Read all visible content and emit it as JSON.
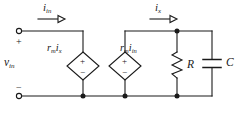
{
  "diagram": {
    "type": "electrical-circuit-schematic",
    "stroke_color": "#1a1a1a",
    "background_color": "#ffffff"
  },
  "port": {
    "name": "input-port",
    "voltage_label": "v",
    "voltage_subscript": "in",
    "plus_sign": "+",
    "minus_sign": "−"
  },
  "currents": [
    {
      "name": "input-current",
      "symbol": "i",
      "subscript": "in",
      "arrow": "⟶"
    },
    {
      "name": "branch-current",
      "symbol": "i",
      "subscript": "x",
      "arrow": "⟶"
    }
  ],
  "sources": [
    {
      "name": "dependent-source-1",
      "kind": "dependent-voltage-source",
      "shape": "diamond",
      "gain_symbol": "r",
      "gain_subscript": "m",
      "driving_symbol": "i",
      "driving_subscript": "x",
      "label": "r_m i_x",
      "polarity_top": "+",
      "polarity_bottom": "−"
    },
    {
      "name": "dependent-source-2",
      "kind": "dependent-voltage-source",
      "shape": "diamond",
      "gain_symbol": "r",
      "gain_subscript": "m",
      "driving_symbol": "i",
      "driving_subscript": "in",
      "label": "r_m i_in",
      "polarity_top": "+",
      "polarity_bottom": "−"
    }
  ],
  "components": [
    {
      "name": "resistor",
      "symbol": "R",
      "style": "zigzag-vertical"
    },
    {
      "name": "capacitor",
      "symbol": "C",
      "style": "parallel-plates-horizontal"
    }
  ],
  "nodes": {
    "junction_dot_count": 4,
    "terminal_circle_count": 2
  }
}
